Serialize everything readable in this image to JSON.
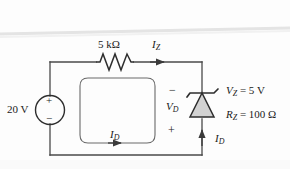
{
  "diagram": {
    "background_color": "#fdfdfd",
    "line_color": "#3a3a3a",
    "zener_fill_color": "#d2d2d2",
    "source": {
      "value_label": "20 V",
      "polarity_plus": "+",
      "polarity_minus": "−"
    },
    "resistor": {
      "value_label": "5 kΩ"
    },
    "currents": {
      "zener_branch": "I",
      "zener_branch_sub": "Z",
      "loop": "I",
      "loop_sub": "D",
      "right_branch": "I",
      "right_branch_sub": "D"
    },
    "voltages": {
      "diode_label": "V",
      "diode_label_sub": "D",
      "diode_minus": "−",
      "diode_plus": "+"
    },
    "zener_specs": {
      "vz_label": "V",
      "vz_sub": "Z",
      "vz_value": " = 5 V",
      "rz_label": "R",
      "rz_sub": "Z",
      "rz_value": " = 100 Ω"
    }
  }
}
